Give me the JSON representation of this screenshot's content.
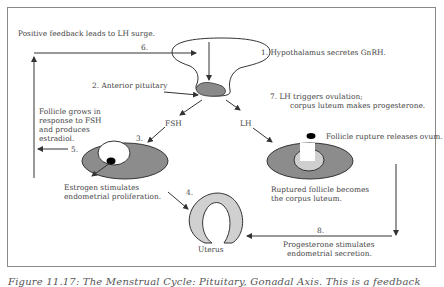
{
  "diagram": {
    "steps": {
      "s1": "1. Hypothalamus secretes GnRH.",
      "s2": "2. Anterior pituitary",
      "s3": "3.",
      "s4": "4.",
      "s5": "5.",
      "s6": "6.",
      "s7_line1": "7. LH triggers ovulation;",
      "s7_line2": "corpus luteum makes progesterone.",
      "s8": "8."
    },
    "labels": {
      "positive_feedback": "Positive feedback leads to LH surge.",
      "fsh": "FSH",
      "lh": "LH",
      "follicle_grows_1": "Follicle grows in",
      "follicle_grows_2": "response to FSH",
      "follicle_grows_3": "and produces",
      "follicle_grows_4": "estradiol.",
      "estrogen_1": "Estrogen stimulates",
      "estrogen_2": "endometrial proliferation.",
      "rupture": "Follicle rupture releases ovum.",
      "ruptured_1": "Ruptured follicle becomes",
      "ruptured_2": "the corpus luteum.",
      "uterus": "Uterus",
      "progesterone_1": "Progesterone stimulates",
      "progesterone_2": "endometrial secretion."
    },
    "colors": {
      "ovary_fill": "#8c8c8c",
      "uterus_fill": "#d0d0d0",
      "pituitary_fill": "#8a8a8a",
      "follicle_fill": "#ffffff",
      "corpus_fill": "#cfcfcf",
      "stroke": "#333333"
    }
  },
  "caption": "Figure 11.17: The Menstrual Cycle: Pituitary, Gonadal Axis. This is a feedback"
}
